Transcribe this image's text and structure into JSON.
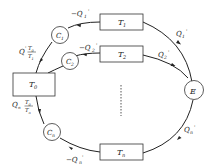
{
  "diagram": {
    "type": "thermodynamic-cycle",
    "nodes": {
      "T0": {
        "label": "T",
        "sub": "0"
      },
      "T1": {
        "label": "T",
        "sub": "1"
      },
      "T2": {
        "label": "T",
        "sub": "2"
      },
      "Tn": {
        "label": "T",
        "sub": "n"
      },
      "E": {
        "label": "E"
      },
      "C1": {
        "label": "C",
        "sub": "1"
      },
      "C2": {
        "label": "C",
        "sub": "2"
      },
      "Cn": {
        "label": "C",
        "sub": "n"
      }
    },
    "edges": {
      "q1_in": {
        "label": "Q",
        "sub": "1",
        "sup": "'"
      },
      "q2_in": {
        "label": "Q",
        "sub": "2",
        "sup": "'"
      },
      "qn_in": {
        "label": "Q",
        "sub": "n",
        "sup": "'"
      },
      "q1_out": {
        "label": "−Q",
        "sub": "1",
        "sup": "'"
      },
      "q2_out": {
        "label": "−Q",
        "sub": "2",
        "sup": "'"
      },
      "qn_out": {
        "label": "−Q",
        "sub": "n",
        "sup": "'"
      },
      "q1_to_T0": {
        "label": "Q",
        "sup": "'",
        "frac_num": "T0",
        "frac_den": "T1"
      },
      "qn_to_T0": {
        "label": "Q",
        "sub": "n",
        "frac_num": "T0",
        "frac_den": "Tn"
      }
    },
    "ellipsis": "⋮"
  }
}
